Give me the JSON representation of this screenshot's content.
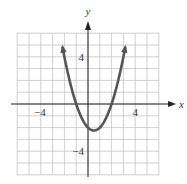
{
  "chart_data": {
    "type": "line",
    "title": "",
    "xlabel": "x",
    "ylabel": "y",
    "xlim": [
      -6,
      6
    ],
    "ylim": [
      -6,
      6
    ],
    "grid": true,
    "grid_step": 1,
    "x_tick_labels": [
      {
        "value": -4,
        "label": "−4"
      },
      {
        "value": 4,
        "label": "4"
      }
    ],
    "y_tick_labels": [
      {
        "value": 4,
        "label": "4"
      },
      {
        "value": -4,
        "label": "−4"
      }
    ],
    "series": [
      {
        "name": "parabola",
        "equation": "y = x^2 - x - 2",
        "x_range": [
          -2.15,
          3.15
        ],
        "arrows_at_ends": true,
        "vertex": [
          0.5,
          -2.25
        ],
        "x_intercepts": [
          -1,
          2
        ],
        "y_intercept": -2
      }
    ],
    "legend": null
  },
  "colors": {
    "grid": "#c4c4c4",
    "axis": "#222222",
    "curve": "#555555",
    "background": "#ffffff"
  },
  "layout": {
    "origin_px": [
      88,
      104
    ],
    "unit_px": 11.8
  }
}
